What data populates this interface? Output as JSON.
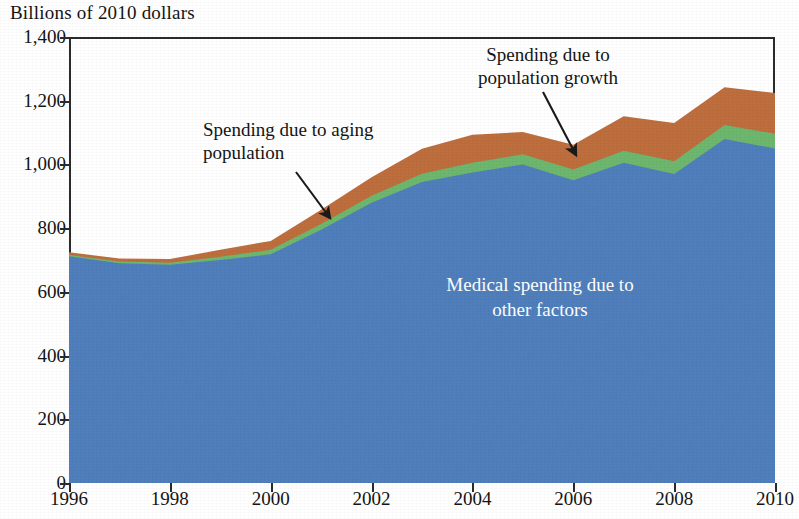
{
  "chart_data": {
    "type": "area",
    "title": "",
    "ylabel": "Billions of 2010 dollars",
    "xlabel": "",
    "stacked": true,
    "grid": false,
    "legend_position": "inline-annotations",
    "xlim": [
      1996,
      2010
    ],
    "ylim": [
      0,
      1400
    ],
    "yticks": [
      0,
      200,
      400,
      600,
      800,
      1000,
      1200,
      1400
    ],
    "ytick_labels": [
      "0",
      "200",
      "400",
      "600",
      "800",
      "1,000",
      "1,200",
      "1,400"
    ],
    "xticks": [
      1996,
      1998,
      2000,
      2002,
      2004,
      2006,
      2008,
      2010
    ],
    "xtick_labels": [
      "1996",
      "1998",
      "2000",
      "2002",
      "2004",
      "2006",
      "2008",
      "2010"
    ],
    "x": [
      1996,
      1997,
      1998,
      1999,
      2000,
      2001,
      2002,
      2003,
      2004,
      2005,
      2006,
      2007,
      2008,
      2009,
      2010
    ],
    "series": [
      {
        "name": "Medical spending due to other factors",
        "color": "#5180be",
        "values": [
          712,
          690,
          685,
          700,
          718,
          795,
          880,
          945,
          975,
          1000,
          950,
          1005,
          970,
          1080,
          1050
        ]
      },
      {
        "name": "Spending due to aging population",
        "color": "#6fb970",
        "values": [
          4,
          5,
          6,
          10,
          14,
          18,
          22,
          26,
          30,
          32,
          34,
          38,
          40,
          44,
          46
        ]
      },
      {
        "name": "Spending due to population growth",
        "color": "#c1703f",
        "values": [
          8,
          10,
          12,
          22,
          28,
          45,
          58,
          78,
          88,
          70,
          78,
          108,
          120,
          118,
          128
        ]
      }
    ],
    "totals": [
      724,
      705,
      703,
      732,
      760,
      858,
      960,
      1049,
      1093,
      1102,
      1062,
      1151,
      1130,
      1242,
      1224
    ],
    "annotations": [
      {
        "id": "aging",
        "text": "Spending due to aging\npopulation",
        "target_x": 2001.2,
        "target_y": 825
      },
      {
        "id": "population-growth",
        "text": "Spending due to\npopulation growth",
        "target_x": 2006.0,
        "target_y": 1010
      },
      {
        "id": "other-factors",
        "text": "Medical spending due to\nother factors",
        "target_x": 2004.6,
        "target_y": 600
      }
    ]
  },
  "colors": {
    "blue": "#5180be",
    "green": "#6fb970",
    "brown": "#c1703f",
    "axis": "#2b2b2b",
    "text": "#141414",
    "inline_label": "#ffffff",
    "background": "#ffffff"
  },
  "axis": {
    "y_title": "Billions of 2010 dollars",
    "y_labels": [
      "1,400",
      "1,200",
      "1,000",
      "800",
      "600",
      "400",
      "200",
      "0"
    ],
    "x_labels": [
      "1996",
      "1998",
      "2000",
      "2002",
      "2004",
      "2006",
      "2008",
      "2010"
    ]
  },
  "annotations": {
    "aging": "Spending due to aging\npopulation",
    "population_growth": "Spending due to\npopulation growth",
    "other_factors": "Medical spending due to\nother factors"
  }
}
